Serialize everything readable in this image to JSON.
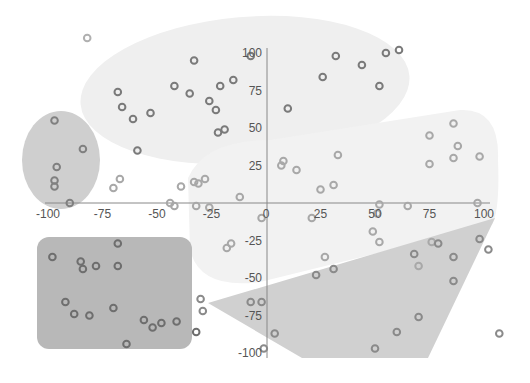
{
  "chart_data": {
    "type": "scatter",
    "title": "",
    "xlabel": "",
    "ylabel": "",
    "xlim": [
      -100,
      100
    ],
    "ylim": [
      -100,
      100
    ],
    "grid": false,
    "legend": null,
    "x_ticks": [
      "-100",
      "-75",
      "-50",
      "-25",
      "0",
      "25",
      "50",
      "75",
      "100"
    ],
    "y_ticks": [
      "100",
      "75",
      "50",
      "25",
      "0",
      "-25",
      "-50",
      "-75",
      "-100"
    ],
    "regions": [
      {
        "name": "top-ellipse",
        "shape": "ellipse",
        "color": "#efefef"
      },
      {
        "name": "left-ellipse",
        "shape": "ellipse",
        "color": "#cfcfcf"
      },
      {
        "name": "right-blob",
        "shape": "rounded-blob",
        "color": "#f2f2f2"
      },
      {
        "name": "bottom-left-rect",
        "shape": "rounded-rect",
        "color": "#b8b8b8"
      },
      {
        "name": "bottom-right-polygon",
        "shape": "polygon",
        "color": "#d0d0d0"
      }
    ],
    "series": [
      {
        "name": "top-cluster",
        "color": "#7a7a7a",
        "points": [
          [
            -33,
            95
          ],
          [
            -68,
            74
          ],
          [
            -66,
            64
          ],
          [
            -61,
            56
          ],
          [
            -53,
            60
          ],
          [
            -42,
            78
          ],
          [
            -35,
            73
          ],
          [
            -26,
            68
          ],
          [
            -23,
            62
          ],
          [
            -21,
            78
          ],
          [
            -15,
            82
          ],
          [
            -22,
            47
          ],
          [
            -19,
            49
          ],
          [
            -59,
            35
          ],
          [
            -7,
            98
          ],
          [
            32,
            98
          ],
          [
            26,
            84
          ],
          [
            10,
            63
          ],
          [
            44,
            92
          ],
          [
            52,
            78
          ],
          [
            55,
            100
          ],
          [
            61,
            102
          ]
        ]
      },
      {
        "name": "left-cluster",
        "color": "#808080",
        "points": [
          [
            -97,
            55
          ],
          [
            -84,
            36
          ],
          [
            -96,
            24
          ],
          [
            -97,
            15
          ],
          [
            -97,
            11
          ],
          [
            -90,
            0
          ]
        ]
      },
      {
        "name": "right-cluster",
        "color": "#a8a8a8",
        "points": [
          [
            -70,
            10
          ],
          [
            -67,
            16
          ],
          [
            -39,
            11
          ],
          [
            -33,
            14
          ],
          [
            -31,
            13
          ],
          [
            -28,
            16
          ],
          [
            -12,
            4
          ],
          [
            -32,
            -2
          ],
          [
            -42,
            -2
          ],
          [
            -44,
            0
          ],
          [
            -26,
            -3
          ],
          [
            -2,
            -10
          ],
          [
            -16,
            -27
          ],
          [
            -18,
            -30
          ],
          [
            7,
            25
          ],
          [
            8,
            28
          ],
          [
            14,
            22
          ],
          [
            25,
            9
          ],
          [
            31,
            12
          ],
          [
            21,
            -10
          ],
          [
            27,
            -36
          ],
          [
            33,
            32
          ],
          [
            52,
            -1
          ],
          [
            51,
            -7
          ],
          [
            49,
            -19
          ],
          [
            52,
            -26
          ],
          [
            65,
            -2
          ],
          [
            70,
            -42
          ],
          [
            76,
            -26
          ],
          [
            75,
            26
          ],
          [
            75,
            45
          ],
          [
            86,
            30
          ],
          [
            88,
            38
          ],
          [
            86,
            53
          ],
          [
            98,
            31
          ],
          [
            97,
            0
          ]
        ]
      },
      {
        "name": "bottom-left-cluster",
        "color": "#6e6e6e",
        "points": [
          [
            -98,
            -36
          ],
          [
            -85,
            -39
          ],
          [
            -84,
            -44
          ],
          [
            -78,
            -42
          ],
          [
            -68,
            -42
          ],
          [
            -68,
            -27
          ],
          [
            -92,
            -66
          ],
          [
            -81,
            -75
          ],
          [
            -70,
            -70
          ],
          [
            -56,
            -78
          ],
          [
            -52,
            -83
          ],
          [
            -48,
            -80
          ],
          [
            -41,
            -79
          ],
          [
            -32,
            -86
          ],
          [
            -64,
            -94
          ],
          [
            -88,
            -74
          ]
        ]
      },
      {
        "name": "bottom-right-cluster",
        "color": "#8a8a8a",
        "points": [
          [
            -30,
            -64
          ],
          [
            -29,
            -72
          ],
          [
            -7,
            -66
          ],
          [
            -2,
            -66
          ],
          [
            4,
            -87
          ],
          [
            -1,
            -97
          ],
          [
            23,
            -48
          ],
          [
            31,
            -44
          ],
          [
            50,
            -97
          ],
          [
            60,
            -86
          ],
          [
            70,
            -76
          ],
          [
            68,
            -34
          ],
          [
            79,
            -27
          ],
          [
            86,
            -36
          ],
          [
            86,
            -52
          ],
          [
            98,
            -24
          ],
          [
            102,
            -31
          ],
          [
            107,
            -87
          ]
        ]
      },
      {
        "name": "outliers",
        "color": "#b0b0b0",
        "points": [
          [
            -82,
            110
          ]
        ]
      }
    ]
  }
}
